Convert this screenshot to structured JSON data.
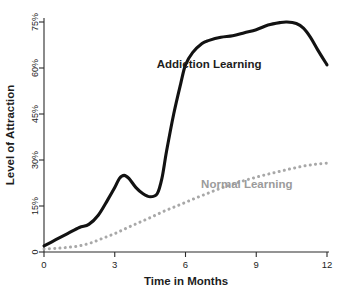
{
  "chart_data": {
    "type": "line",
    "title": "",
    "xlabel": "Time in Months",
    "ylabel": "Level of Attraction",
    "xlim": [
      0,
      12
    ],
    "ylim": [
      0,
      78
    ],
    "grid": false,
    "legend_position": "inline-annotation",
    "xticks": [
      "0",
      "3",
      "6",
      "9",
      "12"
    ],
    "xtick_values": [
      0,
      3,
      6,
      9,
      12
    ],
    "yticks": [
      "0",
      "15%",
      "30%",
      "45%",
      "60%",
      "75%"
    ],
    "ytick_values": [
      0,
      15,
      30,
      45,
      60,
      75
    ],
    "series": [
      {
        "name": "Addiction Learning",
        "style": "solid",
        "color": "#121212",
        "label_text": "Addiction Learning",
        "x": [
          0,
          0.5,
          1.0,
          1.5,
          1.9,
          2.3,
          2.7,
          3.0,
          3.2,
          3.4,
          3.6,
          3.9,
          4.2,
          4.5,
          4.8,
          5.0,
          5.2,
          5.5,
          5.8,
          6.0,
          6.3,
          6.7,
          7.0,
          7.5,
          8.0,
          8.5,
          9.0,
          9.5,
          10.0,
          10.3,
          10.7,
          11.0,
          11.3,
          11.6,
          12.0
        ],
        "y": [
          2,
          4,
          6,
          8,
          9,
          12,
          17,
          21,
          24,
          25,
          24,
          21,
          19,
          18,
          19,
          24,
          33,
          45,
          55,
          61,
          65,
          68,
          69,
          70,
          70.5,
          71.5,
          72.5,
          74,
          74.8,
          75,
          74.5,
          73,
          70,
          66,
          61
        ]
      },
      {
        "name": "Normal Learning",
        "style": "dotted",
        "color": "#a8a8a8",
        "label_text": "Normal Learning",
        "x": [
          0,
          0.5,
          1.0,
          1.5,
          2.0,
          2.5,
          3.0,
          3.5,
          4.0,
          4.5,
          5.0,
          5.5,
          6.0,
          6.5,
          7.0,
          7.5,
          8.0,
          8.5,
          9.0,
          9.5,
          10.0,
          10.5,
          11.0,
          11.5,
          12.0
        ],
        "y": [
          1,
          1.2,
          1.5,
          2,
          3,
          4.5,
          6,
          7.8,
          9.5,
          11.2,
          13,
          14.6,
          16.2,
          17.8,
          19.3,
          20.8,
          22.1,
          23.3,
          24.4,
          25.4,
          26.3,
          27.2,
          28.0,
          28.6,
          29.0
        ]
      }
    ],
    "annotations": [
      {
        "name": "addiction-learning-label",
        "text": "Addiction Learning",
        "x": 7.0,
        "y": 60,
        "color": "#1d1d1d"
      },
      {
        "name": "normal-learning-label",
        "text": "Normal Learning",
        "x": 8.6,
        "y": 21,
        "color": "#9b9b9b"
      }
    ]
  },
  "axes": {
    "x_title": "Time in Months",
    "y_title": "Level of Attraction"
  },
  "colors": {
    "addiction_series": "#121212",
    "normal_series": "#a8a8a8",
    "axis": "#2b2b2b",
    "background": "#ffffff"
  }
}
